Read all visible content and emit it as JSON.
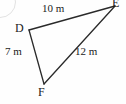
{
  "figure": {
    "type": "triangle-diagram",
    "background_color": "#fefefe",
    "stroke_color": "#2a2a2a",
    "text_color": "#1b1b1b",
    "unit": "m",
    "vertices": [
      {
        "id": "D",
        "label": "D",
        "x": 29,
        "y": 30
      },
      {
        "id": "E",
        "label": "E",
        "x": 115,
        "y": 6
      },
      {
        "id": "F",
        "label": "F",
        "x": 44,
        "y": 84
      }
    ],
    "sides": [
      {
        "id": "DE",
        "from": "D",
        "to": "E",
        "label": "10 m",
        "length": 10
      },
      {
        "id": "FE",
        "from": "F",
        "to": "E",
        "label": "12 m",
        "length": 12
      },
      {
        "id": "DF",
        "from": "D",
        "to": "F",
        "label": "7 m",
        "length": 7
      }
    ]
  }
}
